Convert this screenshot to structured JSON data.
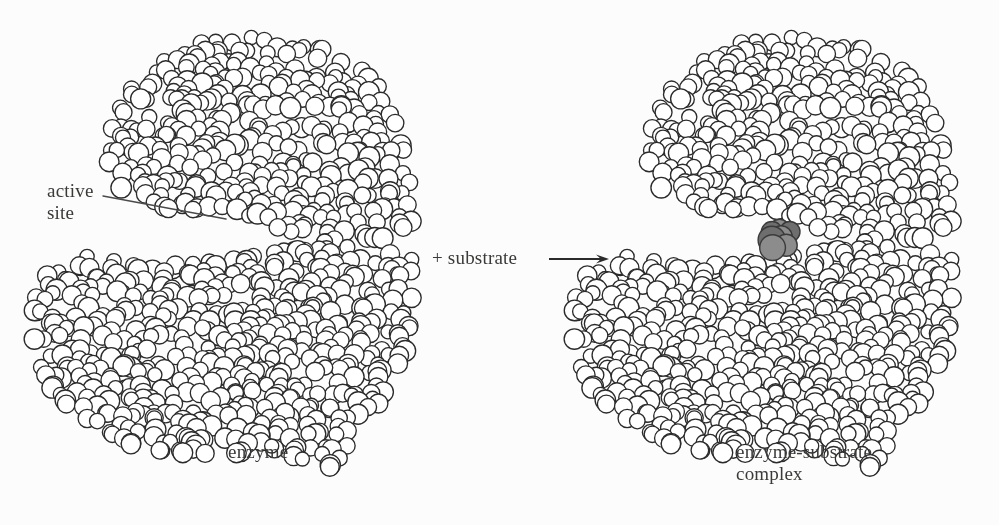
{
  "figure": {
    "background_color": "#fcfcfc",
    "ink_color": "#2b2b2b",
    "label_color": "#3a3a38",
    "substrate_color": "#6e6e6e",
    "substrate_color_light": "#8c8c8c",
    "sphere_fill": "#ffffff"
  },
  "labels": {
    "active_site": "active\nsite",
    "plus_substrate": "+ substrate",
    "enzyme": "enzyme",
    "enzyme_substrate_complex": "enzyme-substrate\ncomplex"
  },
  "leader_line": {
    "name": "active-site-leader-line",
    "x1": 103,
    "y1": 196,
    "x2": 226,
    "y2": 219,
    "width": 1.4
  },
  "reaction_arrow": {
    "name": "reaction-arrow",
    "x1": 549,
    "y1": 259,
    "x2": 609,
    "y2": 259,
    "head_length": 13,
    "head_width": 9,
    "width": 2.2
  },
  "molecules": [
    {
      "name": "enzyme",
      "center_x": 222,
      "center_y": 252,
      "radius_x": 190,
      "radius_y": 215,
      "sphere_count": 900,
      "sphere_radius_min": 7.0,
      "sphere_radius_max": 10.5,
      "seed": 20240917,
      "has_substrate": false,
      "active_site_x": 252,
      "active_site_y": 236
    },
    {
      "name": "enzyme-substrate-complex",
      "center_x": 762,
      "center_y": 252,
      "radius_x": 190,
      "radius_y": 215,
      "sphere_count": 900,
      "sphere_radius_min": 7.0,
      "sphere_radius_max": 10.5,
      "seed": 20240917,
      "has_substrate": true,
      "active_site_x": 782,
      "active_site_y": 236
    }
  ],
  "substrate": {
    "name": "substrate-cluster",
    "center_x": 781,
    "center_y": 237,
    "sphere_count": 7,
    "sphere_radius": 12.5,
    "spread": 15
  }
}
